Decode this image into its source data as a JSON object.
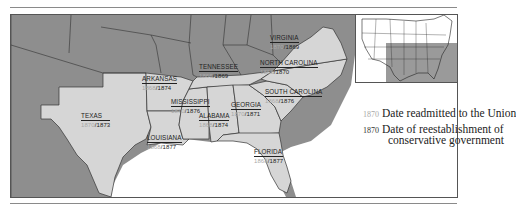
{
  "map": {
    "title": "Reconstruction in the South",
    "colors": {
      "other_states": "#8e8e8e",
      "confederate_states": "#d6d6d6",
      "water": "#ffffff",
      "border": "#333333",
      "readmitted_date_color": "#a8a8a8",
      "conservative_date_color": "#222222"
    },
    "states": [
      {
        "name": "VIRGINIA",
        "readmitted": "1870",
        "conservative": "1869"
      },
      {
        "name": "NORTH CAROLINA",
        "readmitted": "1868",
        "conservative": "1870"
      },
      {
        "name": "TENNESSEE",
        "readmitted": "1866",
        "conservative": "1869"
      },
      {
        "name": "ARKANSAS",
        "readmitted": "1868",
        "conservative": "1874"
      },
      {
        "name": "SOUTH CAROLINA",
        "readmitted": "1868",
        "conservative": "1876"
      },
      {
        "name": "MISSISSIPPI",
        "readmitted": "1870",
        "conservative": "1876"
      },
      {
        "name": "GEORGIA",
        "readmitted": "1870",
        "conservative": "1871"
      },
      {
        "name": "ALABAMA",
        "readmitted": "1868",
        "conservative": "1874"
      },
      {
        "name": "TEXAS",
        "readmitted": "1870",
        "conservative": "1873"
      },
      {
        "name": "LOUISIANA",
        "readmitted": "1868",
        "conservative": "1877"
      },
      {
        "name": "FLORIDA",
        "readmitted": "1868",
        "conservative": "1877"
      }
    ],
    "legend": [
      {
        "year": "1870",
        "style": "light",
        "text": "Date readmitted to the Union"
      },
      {
        "year": "1870",
        "style": "dark",
        "text": "Date of reestablishment of",
        "text2": "conservative government"
      }
    ],
    "inset": {
      "description": "Locator map of the United States with the South highlighted"
    }
  }
}
